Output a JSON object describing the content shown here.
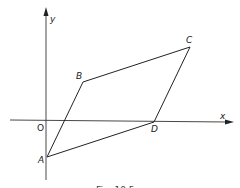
{
  "figure": {
    "axes": {
      "x_label": "x",
      "y_label": "y",
      "origin_label": "O"
    },
    "points": [
      {
        "name": "A",
        "x": 47,
        "y": 157,
        "label_x": 38,
        "label_y": 163
      },
      {
        "name": "B",
        "x": 83,
        "y": 82,
        "label_x": 76,
        "label_y": 79
      },
      {
        "name": "C",
        "x": 190,
        "y": 47,
        "label_x": 186,
        "label_y": 43
      },
      {
        "name": "D",
        "x": 154,
        "y": 122,
        "label_x": 151,
        "label_y": 132
      }
    ],
    "shape": "parallelogram ABCD",
    "caption": "Fig. 10.5"
  }
}
